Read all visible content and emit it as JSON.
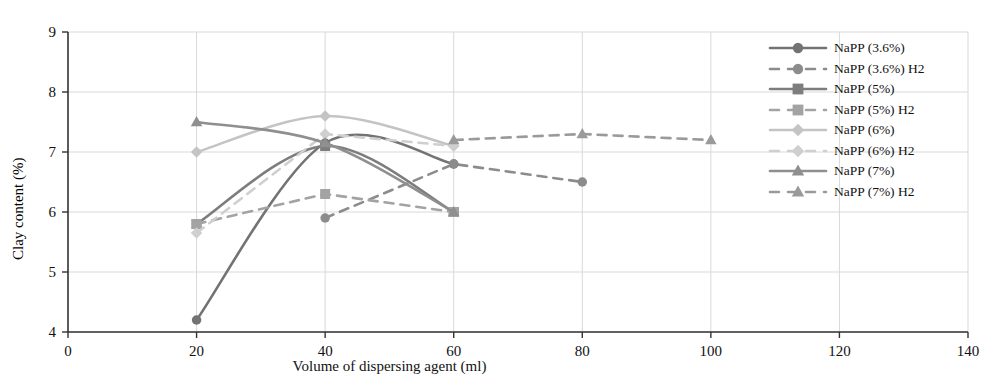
{
  "chart_data": {
    "type": "line",
    "title": "",
    "xlabel": "Volume of dispersing agent (ml)",
    "ylabel": "Clay content (%)",
    "xlim": [
      0,
      140
    ],
    "ylim": [
      4,
      9
    ],
    "xticks": [
      0,
      20,
      40,
      60,
      80,
      100,
      120,
      140
    ],
    "yticks": [
      4,
      5,
      6,
      7,
      8,
      9
    ],
    "grid": true,
    "legend_position": "top-right",
    "series": [
      {
        "name": "NaPP (3.6%)",
        "style": "solid",
        "marker": "circle",
        "color": "#737373",
        "x": [
          20,
          40,
          60
        ],
        "values": [
          4.2,
          7.15,
          6.8
        ]
      },
      {
        "name": "NaPP (3.6%) H2",
        "style": "dashed",
        "marker": "circle",
        "color": "#8c8c8c",
        "x": [
          40,
          60,
          80
        ],
        "values": [
          5.9,
          6.8,
          6.5
        ]
      },
      {
        "name": "NaPP (5%)",
        "style": "solid",
        "marker": "square",
        "color": "#7d7d7d",
        "x": [
          20,
          40,
          60
        ],
        "values": [
          5.8,
          7.1,
          6.0
        ]
      },
      {
        "name": "NaPP (5%) H2",
        "style": "dashed",
        "marker": "square",
        "color": "#a3a3a3",
        "x": [
          20,
          40,
          60
        ],
        "values": [
          5.8,
          6.3,
          6.0
        ]
      },
      {
        "name": "NaPP (6%)",
        "style": "solid",
        "marker": "diamond",
        "color": "#c4c4c4",
        "x": [
          20,
          40,
          60
        ],
        "values": [
          7.0,
          7.6,
          7.1
        ]
      },
      {
        "name": "NaPP (6%) H2",
        "style": "dashed",
        "marker": "diamond",
        "color": "#cfcfcf",
        "x": [
          20,
          40,
          60
        ],
        "values": [
          5.65,
          7.3,
          7.1
        ]
      },
      {
        "name": "NaPP (7%)",
        "style": "solid",
        "marker": "triangle",
        "color": "#8f8f8f",
        "x": [
          20,
          40,
          60
        ],
        "values": [
          7.5,
          7.15,
          6.0
        ]
      },
      {
        "name": "NaPP (7%) H2",
        "style": "dashed",
        "marker": "triangle",
        "color": "#9a9a9a",
        "x": [
          60,
          80,
          100
        ],
        "values": [
          7.2,
          7.3,
          7.2
        ]
      }
    ]
  },
  "axes": {
    "x_title": "Volume of dispersing agent (ml)",
    "y_title": "Clay content (%)",
    "x_tick_labels": [
      "0",
      "20",
      "40",
      "60",
      "80",
      "100",
      "120",
      "140"
    ],
    "y_tick_labels": [
      "4",
      "5",
      "6",
      "7",
      "8",
      "9"
    ]
  },
  "legend": {
    "items": [
      {
        "label": "NaPP (3.6%)"
      },
      {
        "label": "NaPP (3.6%) H2"
      },
      {
        "label": "NaPP (5%)"
      },
      {
        "label": "NaPP (5%) H2"
      },
      {
        "label": "NaPP (6%)"
      },
      {
        "label": "NaPP (6%) H2"
      },
      {
        "label": "NaPP (7%)"
      },
      {
        "label": "NaPP (7%) H2"
      }
    ]
  },
  "colors": {
    "axis": "#333333",
    "grid": "#d9d9d9",
    "text": "#111111"
  }
}
